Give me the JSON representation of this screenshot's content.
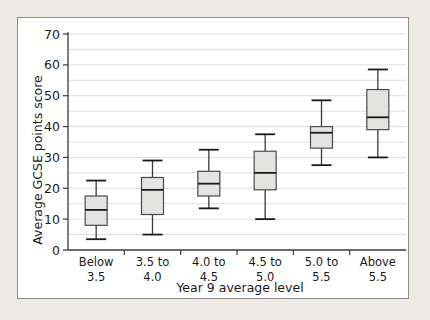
{
  "chart_data": {
    "type": "box",
    "title": "",
    "xlabel": "Year 9 average level",
    "ylabel": "Average GCSE points score",
    "ylim": [
      0,
      70
    ],
    "ytick_labels": [
      "0",
      "10",
      "20",
      "30",
      "40",
      "50",
      "60",
      "70"
    ],
    "ytick_values": [
      0,
      10,
      20,
      30,
      40,
      50,
      60,
      70
    ],
    "minor_gridlines": [
      5,
      15,
      25,
      35,
      45,
      55,
      65
    ],
    "grid": true,
    "legend": "none",
    "categories": [
      "Below\n3.5",
      "3.5 to\n4.0",
      "4.0 to\n4.5",
      "4.5 to\n5.0",
      "5.0 to\n5.5",
      "Above\n5.5"
    ],
    "category_lines": [
      [
        "Below",
        "3.5"
      ],
      [
        "3.5 to",
        "4.0"
      ],
      [
        "4.0 to",
        "4.5"
      ],
      [
        "4.5 to",
        "5.0"
      ],
      [
        "5.0 to",
        "5.5"
      ],
      [
        "Above",
        "5.5"
      ]
    ],
    "boxes": [
      {
        "category": "Below 3.5",
        "min": 3.5,
        "q1": 8.0,
        "median": 13.0,
        "q3": 17.5,
        "max": 22.5
      },
      {
        "category": "3.5 to 4.0",
        "min": 5.0,
        "q1": 11.5,
        "median": 19.5,
        "q3": 23.5,
        "max": 29.0
      },
      {
        "category": "4.0 to 4.5",
        "min": 13.5,
        "q1": 17.5,
        "median": 21.5,
        "q3": 25.5,
        "max": 32.5
      },
      {
        "category": "4.5 to 5.0",
        "min": 10.0,
        "q1": 19.5,
        "median": 25.0,
        "q3": 32.0,
        "max": 37.5
      },
      {
        "category": "5.0 to 5.5",
        "min": 27.5,
        "q1": 33.0,
        "median": 38.0,
        "q3": 40.0,
        "max": 48.5
      },
      {
        "category": "Above 5.5",
        "min": 30.0,
        "q1": 39.0,
        "median": 43.0,
        "q3": 52.0,
        "max": 58.5
      }
    ]
  },
  "colors": {
    "page_background": "#edeae4",
    "panel_background": "#ffffff",
    "panel_border": "#8d8d8d",
    "box_fill": "#e3e3e1",
    "box_stroke": "#4a4a4a",
    "median_stroke": "#1a1a1a",
    "gridline": "#d6d6d6",
    "axis": "#3a3a3a",
    "text": "#1a1a1a"
  }
}
